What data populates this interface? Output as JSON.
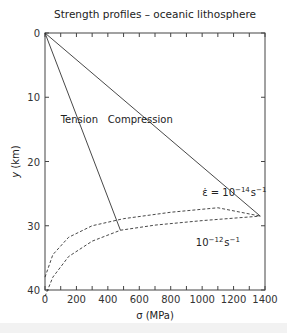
{
  "chart_data": {
    "type": "line",
    "title": "Strength profiles – oceanic lithosphere",
    "xlabel": "σ (MPa)",
    "ylabel": "y (km)",
    "xlim": [
      0,
      1400
    ],
    "ylim": [
      40,
      0
    ],
    "y_inverted": true,
    "x_ticks": [
      "0",
      "200",
      "400",
      "600",
      "800",
      "1000",
      "1200",
      "1400"
    ],
    "y_ticks": [
      "0",
      "10",
      "20",
      "30",
      "40"
    ],
    "grid": false,
    "legend": null,
    "series": [
      {
        "name": "Tension",
        "style": "solid",
        "points": [
          [
            0,
            0
          ],
          [
            480,
            30.7
          ]
        ]
      },
      {
        "name": "Compression",
        "style": "solid",
        "points": [
          [
            0,
            0
          ],
          [
            1370,
            28.5
          ]
        ]
      },
      {
        "name": "ε̇ = 10^-14 s^-1",
        "style": "dashed",
        "points": [
          [
            0,
            38
          ],
          [
            50,
            34.5
          ],
          [
            150,
            31.8
          ],
          [
            300,
            30.0
          ],
          [
            500,
            28.9
          ],
          [
            800,
            27.9
          ],
          [
            1100,
            27.2
          ],
          [
            1370,
            28.5
          ]
        ]
      },
      {
        "name": "10^-12 s^-1",
        "style": "dashed",
        "points": [
          [
            0,
            41
          ],
          [
            50,
            38
          ],
          [
            150,
            34.8
          ],
          [
            300,
            32.4
          ],
          [
            480,
            30.7
          ],
          [
            700,
            29.9
          ],
          [
            1000,
            29.2
          ],
          [
            1370,
            28.5
          ]
        ]
      }
    ],
    "annotations": [
      {
        "text": "Tension",
        "x": 100,
        "y": 13.5
      },
      {
        "text": "Compression",
        "x": 400,
        "y": 13.5
      },
      {
        "text": "ε̇ = 10^-14 s^-1",
        "x": 1030,
        "y": 25.5
      },
      {
        "text": "10^-12 s^-1",
        "x": 980,
        "y": 33
      }
    ]
  },
  "labels": {
    "title": "Strength profiles – oceanic lithosphere",
    "xlabel": "σ (MPa)",
    "ylabel_y": "y",
    "ylabel_unit": " (km)",
    "tension": "Tension",
    "compression": "Compression",
    "rate1_prefix": "ε̇ = 10",
    "rate1_exp": "−14",
    "rate1_unit": "s",
    "rate1_unit_exp": "−1",
    "rate2_prefix": "10",
    "rate2_exp": "−12",
    "rate2_unit": "s",
    "rate2_unit_exp": "−1"
  }
}
